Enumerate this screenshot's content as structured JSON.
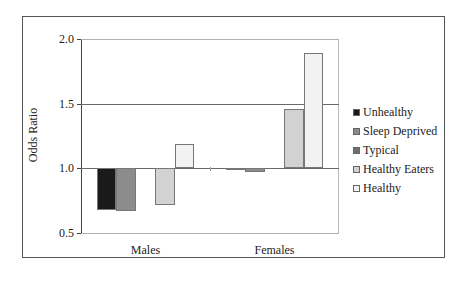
{
  "chart_data": {
    "type": "bar",
    "title": "",
    "xlabel": "",
    "ylabel": "Odds Ratio",
    "ylim": [
      0.5,
      2.0
    ],
    "yticks": [
      "0.5",
      "1.0",
      "1.5",
      "2.0"
    ],
    "baseline": 1.0,
    "grid": true,
    "legend_position": "right",
    "categories": [
      "Males",
      "Females"
    ],
    "series": [
      {
        "name": "Unhealthy",
        "color": "#1a1a1a",
        "values": [
          0.68,
          0.99
        ]
      },
      {
        "name": "Sleep Deprived",
        "color": "#8c8c8c",
        "values": [
          0.67,
          0.97
        ]
      },
      {
        "name": "Typical",
        "color": "#6e6e6e",
        "values": [
          1.0,
          1.0
        ]
      },
      {
        "name": "Healthy Eaters",
        "color": "#d2d2d2",
        "values": [
          0.72,
          1.46
        ]
      },
      {
        "name": "Healthy",
        "color": "#f2f2f2",
        "values": [
          1.19,
          1.89
        ]
      }
    ]
  }
}
